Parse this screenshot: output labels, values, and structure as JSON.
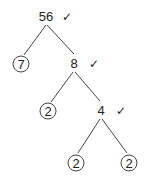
{
  "nodes": {
    "root": {
      "value": "56",
      "check": "✓"
    },
    "n7": {
      "value": "7",
      "prime": true
    },
    "n8": {
      "value": "8",
      "check": "✓"
    },
    "n2a": {
      "value": "2",
      "prime": true
    },
    "n4": {
      "value": "4",
      "check": "✓"
    },
    "n2b": {
      "value": "2",
      "prime": true
    },
    "n2c": {
      "value": "2",
      "prime": true
    }
  },
  "colors": {
    "ink": "#222222",
    "background": "#ffffff"
  }
}
